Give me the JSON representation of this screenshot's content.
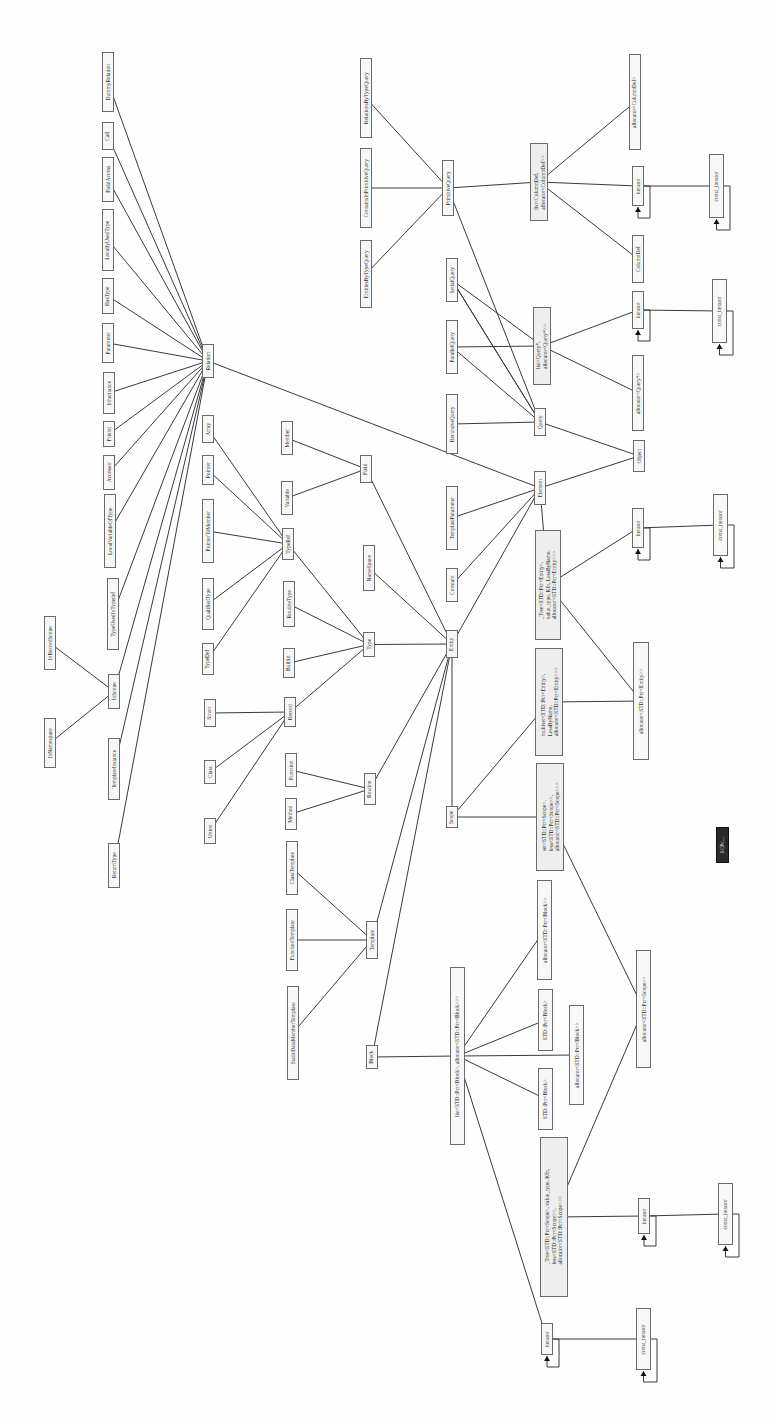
{
  "diagram": {
    "orientation": "rotated-90-ccw",
    "nodes": [
      {
        "id": "DummyRelation",
        "label": "DummyRelation",
        "x": 102,
        "y": 52,
        "w": 12,
        "h": 60
      },
      {
        "id": "Call",
        "label": "Call",
        "x": 102,
        "y": 122,
        "w": 12,
        "h": 28
      },
      {
        "id": "FieldAccess",
        "label": "FieldAccess",
        "x": 102,
        "y": 157,
        "w": 12,
        "h": 45
      },
      {
        "id": "LocallyUsedType",
        "label": "LocallyUsedType",
        "x": 102,
        "y": 209,
        "w": 12,
        "h": 62
      },
      {
        "id": "HasType",
        "label": "HasType",
        "x": 102,
        "y": 278,
        "w": 12,
        "h": 36
      },
      {
        "id": "Parameter",
        "label": "Parameter",
        "x": 102,
        "y": 323,
        "w": 12,
        "h": 40
      },
      {
        "id": "Inheritance",
        "label": "Inheritance",
        "x": 103,
        "y": 372,
        "w": 12,
        "h": 42
      },
      {
        "id": "Friend",
        "label": "Friend",
        "x": 103,
        "y": 421,
        "w": 12,
        "h": 26
      },
      {
        "id": "Accessor",
        "label": "Accessor",
        "x": 103,
        "y": 455,
        "w": 12,
        "h": 35
      },
      {
        "id": "LocalVariableOfType",
        "label": "LocalVariableOfType",
        "x": 104,
        "y": 494,
        "w": 12,
        "h": 74
      },
      {
        "id": "TypeUsedInTypedef",
        "label": "TypeUsedInTypedef",
        "x": 107,
        "y": 578,
        "w": 12,
        "h": 72
      },
      {
        "id": "InScope",
        "label": "InScope",
        "x": 108,
        "y": 674,
        "w": 12,
        "h": 35
      },
      {
        "id": "TemplateInstance",
        "label": "TemplateInstance",
        "x": 108,
        "y": 738,
        "w": 12,
        "h": 62
      },
      {
        "id": "ReturnType",
        "label": "ReturnType",
        "x": 108,
        "y": 843,
        "w": 12,
        "h": 45
      },
      {
        "id": "InRecordScope",
        "label": "InRecordScope",
        "x": 44,
        "y": 616,
        "w": 12,
        "h": 54
      },
      {
        "id": "InNamespace",
        "label": "InNamespace",
        "x": 44,
        "y": 718,
        "w": 12,
        "h": 50
      },
      {
        "id": "Relation",
        "label": "Relation",
        "x": 202,
        "y": 344,
        "w": 12,
        "h": 34
      },
      {
        "id": "Member",
        "label": "Member",
        "x": 281,
        "y": 421,
        "w": 12,
        "h": 34
      },
      {
        "id": "Variable",
        "label": "Variable",
        "x": 281,
        "y": 481,
        "w": 12,
        "h": 34
      },
      {
        "id": "Field",
        "label": "Field",
        "x": 360,
        "y": 455,
        "w": 12,
        "h": 28
      },
      {
        "id": "Array",
        "label": "Array",
        "x": 202,
        "y": 415,
        "w": 12,
        "h": 28
      },
      {
        "id": "Pointer",
        "label": "Pointer",
        "x": 202,
        "y": 455,
        "w": 12,
        "h": 30
      },
      {
        "id": "PointerToMember",
        "label": "PointerToMember",
        "x": 202,
        "y": 499,
        "w": 12,
        "h": 64
      },
      {
        "id": "QualifiedType",
        "label": "QualifiedType",
        "x": 202,
        "y": 578,
        "w": 12,
        "h": 52
      },
      {
        "id": "TypeDef",
        "label": "TypeDef",
        "x": 202,
        "y": 643,
        "w": 12,
        "h": 32
      },
      {
        "id": "TypeRef",
        "label": "TypeRef",
        "x": 282,
        "y": 528,
        "w": 12,
        "h": 32
      },
      {
        "id": "NameSpace",
        "label": "NameSpace",
        "x": 363,
        "y": 545,
        "w": 12,
        "h": 46
      },
      {
        "id": "RoutineType",
        "label": "RoutineType",
        "x": 283,
        "y": 581,
        "w": 12,
        "h": 46
      },
      {
        "id": "Builtin",
        "label": "Builtin",
        "x": 283,
        "y": 648,
        "w": 12,
        "h": 30
      },
      {
        "id": "Type",
        "label": "Type",
        "x": 363,
        "y": 632,
        "w": 12,
        "h": 25
      },
      {
        "id": "Struct",
        "label": "Struct",
        "x": 204,
        "y": 699,
        "w": 12,
        "h": 28
      },
      {
        "id": "Class",
        "label": "Class",
        "x": 204,
        "y": 760,
        "w": 12,
        "h": 24
      },
      {
        "id": "Union",
        "label": "Union",
        "x": 204,
        "y": 818,
        "w": 12,
        "h": 26
      },
      {
        "id": "Record",
        "label": "Record",
        "x": 284,
        "y": 697,
        "w": 12,
        "h": 30
      },
      {
        "id": "Function",
        "label": "Function",
        "x": 285,
        "y": 753,
        "w": 12,
        "h": 34
      },
      {
        "id": "Method",
        "label": "Method",
        "x": 285,
        "y": 798,
        "w": 12,
        "h": 32
      },
      {
        "id": "Routine",
        "label": "Routine",
        "x": 364,
        "y": 773,
        "w": 12,
        "h": 32
      },
      {
        "id": "ClassTemplate",
        "label": "ClassTemplate",
        "x": 286,
        "y": 841,
        "w": 12,
        "h": 54
      },
      {
        "id": "FunctionTemplate",
        "label": "FunctionTemplate",
        "x": 286,
        "y": 909,
        "w": 12,
        "h": 62
      },
      {
        "id": "StaticDataMemberTemplate",
        "label": "StaticDataMemberTemplate",
        "x": 287,
        "y": 986,
        "w": 12,
        "h": 94
      },
      {
        "id": "Template",
        "label": "Template",
        "x": 366,
        "y": 921,
        "w": 12,
        "h": 38
      },
      {
        "id": "Block",
        "label": "Block",
        "x": 366,
        "y": 1045,
        "w": 12,
        "h": 24
      },
      {
        "id": "Entity",
        "label": "Entity",
        "x": 446,
        "y": 630,
        "w": 12,
        "h": 28
      },
      {
        "id": "Scope",
        "label": "Scope",
        "x": 446,
        "y": 806,
        "w": 12,
        "h": 22
      },
      {
        "id": "Constant",
        "label": "Constant",
        "x": 446,
        "y": 568,
        "w": 12,
        "h": 34
      },
      {
        "id": "TemplateParameter",
        "label": "TemplateParameter",
        "x": 446,
        "y": 486,
        "w": 12,
        "h": 64
      },
      {
        "id": "Element",
        "label": "Element",
        "x": 534,
        "y": 471,
        "w": 12,
        "h": 34
      },
      {
        "id": "RecursiveQuery",
        "label": "RecursiveQuery",
        "x": 446,
        "y": 394,
        "w": 12,
        "h": 60
      },
      {
        "id": "Query",
        "label": "Query",
        "x": 534,
        "y": 408,
        "w": 12,
        "h": 28
      },
      {
        "id": "Object",
        "label": "Object",
        "x": 633,
        "y": 440,
        "w": 12,
        "h": 32
      },
      {
        "id": "ParallelQuery",
        "label": "ParallelQuery",
        "x": 446,
        "y": 320,
        "w": 12,
        "h": 54
      },
      {
        "id": "SerialQuery",
        "label": "SerialQuery",
        "x": 446,
        "y": 258,
        "w": 12,
        "h": 44
      },
      {
        "id": "ListQueryPtr",
        "label": "list<Query*,\nallocator<Query*>>",
        "x": 533,
        "y": 307,
        "w": 18,
        "h": 78
      },
      {
        "id": "AllocatorQuery",
        "label": "allocator<Query*>",
        "x": 632,
        "y": 355,
        "w": 12,
        "h": 76
      },
      {
        "id": "IteratorQ",
        "label": "iterator",
        "x": 632,
        "y": 291,
        "w": 12,
        "h": 38
      },
      {
        "id": "ConstIteratorQ",
        "label": "const_iterator",
        "x": 712,
        "y": 279,
        "w": 15,
        "h": 64
      },
      {
        "id": "EntitiesByTypeQuery",
        "label": "EntitiesByTypeQuery",
        "x": 360,
        "y": 240,
        "w": 12,
        "h": 68
      },
      {
        "id": "ContainsInPrimitiveQuery",
        "label": "ContainsInPrimitiveQuery",
        "x": 360,
        "y": 148,
        "w": 12,
        "h": 80
      },
      {
        "id": "RelationsByTypeQuery",
        "label": "RelationsByTypeQuery",
        "x": 360,
        "y": 58,
        "w": 12,
        "h": 80
      },
      {
        "id": "PrimitiveQuery",
        "label": "PrimitiveQuery",
        "x": 442,
        "y": 160,
        "w": 12,
        "h": 56
      },
      {
        "id": "ListColumnDef",
        "label": "list<ColumnDef,\nallocator<ColumnDef>>",
        "x": 530,
        "y": 143,
        "w": 18,
        "h": 78
      },
      {
        "id": "ColumnDef",
        "label": "ColumnDef",
        "x": 632,
        "y": 235,
        "w": 12,
        "h": 48
      },
      {
        "id": "IteratorC",
        "label": "iterator",
        "x": 632,
        "y": 166,
        "w": 12,
        "h": 40
      },
      {
        "id": "ConstIteratorC",
        "label": "const_iterator",
        "x": 709,
        "y": 154,
        "w": 15,
        "h": 64
      },
      {
        "id": "AllocatorColumnDef",
        "label": "allocator<ColumnDef>",
        "x": 629,
        "y": 54,
        "w": 12,
        "h": 96
      },
      {
        "id": "MapEntity",
        "label": "_Tree<STD::Pcr<Entity>,\nvalue_type, Kfn, LessByName,\nallocator<STD::Pcr<Entity>>>",
        "x": 535,
        "y": 530,
        "w": 26,
        "h": 110
      },
      {
        "id": "IteratorE",
        "label": "iterator",
        "x": 632,
        "y": 508,
        "w": 12,
        "h": 40
      },
      {
        "id": "ConstIteratorE",
        "label": "const_iterator",
        "x": 713,
        "y": 494,
        "w": 15,
        "h": 62
      },
      {
        "id": "MultisetEntity",
        "label": "multiset<STD::Pcr<Entity>,\nLessByName,\nallocator<STD::Pcr<Entity>>>",
        "x": 535,
        "y": 648,
        "w": 28,
        "h": 108
      },
      {
        "id": "AllocatorEntity",
        "label": "allocator<STD::Pcr<Entity>>",
        "x": 633,
        "y": 642,
        "w": 16,
        "h": 118
      },
      {
        "id": "SetScope",
        "label": "set<STD::Pcr<Scope>,\nless<STD::Pcr<Scope>>,\nallocator<STD::Pcr<Scope>>>",
        "x": 536,
        "y": 763,
        "w": 28,
        "h": 108
      },
      {
        "id": "DarkBlock",
        "label": "SCPc...",
        "x": 716,
        "y": 827,
        "w": 13,
        "h": 36,
        "dark": true
      },
      {
        "id": "ListBlock",
        "label": "list<STD::Pcr<Block>, allocator<STD::Pcr<Block>>>",
        "x": 450,
        "y": 967,
        "w": 15,
        "h": 178
      },
      {
        "id": "AllocatorBlock1",
        "label": "allocator<STD::Pcr<Block>>",
        "x": 537,
        "y": 880,
        "w": 15,
        "h": 100
      },
      {
        "id": "STDPcrBlock1",
        "label": "STD::Pcr<Block>",
        "x": 538,
        "y": 989,
        "w": 15,
        "h": 62
      },
      {
        "id": "AllocatorBlock2",
        "label": "allocator<STD::Pcr<Block>>",
        "x": 569,
        "y": 1005,
        "w": 15,
        "h": 100
      },
      {
        "id": "STDPcrBlock2",
        "label": "STD::Pcr<Block>",
        "x": 538,
        "y": 1068,
        "w": 15,
        "h": 62
      },
      {
        "id": "AllocatorScope",
        "label": "allocator<STD::Pcr<Scope>>",
        "x": 636,
        "y": 950,
        "w": 15,
        "h": 118
      },
      {
        "id": "TreeScope",
        "label": "_Tree<STD::Pcr<Scope>, value_type, Kfn,\nless<STD::Pcr<Scope>>,\nallocator<STD::Pcr<Scope>>>",
        "x": 540,
        "y": 1137,
        "w": 28,
        "h": 160
      },
      {
        "id": "IteratorS",
        "label": "iterator",
        "x": 638,
        "y": 1198,
        "w": 12,
        "h": 36
      },
      {
        "id": "ConstIteratorS",
        "label": "const_iterator",
        "x": 718,
        "y": 1183,
        "w": 15,
        "h": 62
      },
      {
        "id": "IteratorB",
        "label": "iterator",
        "x": 541,
        "y": 1323,
        "w": 12,
        "h": 32
      },
      {
        "id": "ConstIteratorB",
        "label": "const_iterator",
        "x": 636,
        "y": 1308,
        "w": 15,
        "h": 62
      }
    ],
    "edges": [
      [
        "DummyRelation",
        "Relation"
      ],
      [
        "Call",
        "Relation"
      ],
      [
        "FieldAccess",
        "Relation"
      ],
      [
        "LocallyUsedType",
        "Relation"
      ],
      [
        "HasType",
        "Relation"
      ],
      [
        "Parameter",
        "Relation"
      ],
      [
        "Inheritance",
        "Relation"
      ],
      [
        "Friend",
        "Relation"
      ],
      [
        "Accessor",
        "Relation"
      ],
      [
        "LocalVariableOfType",
        "Relation"
      ],
      [
        "TypeUsedInTypedef",
        "Relation"
      ],
      [
        "InScope",
        "Relation"
      ],
      [
        "TemplateInstance",
        "Relation"
      ],
      [
        "ReturnType",
        "Relation"
      ],
      [
        "InRecordScope",
        "InScope"
      ],
      [
        "InNamespace",
        "InScope"
      ],
      [
        "Relation",
        "Element"
      ],
      [
        "Member",
        "Field"
      ],
      [
        "Variable",
        "Field"
      ],
      [
        "Field",
        "Entity"
      ],
      [
        "Array",
        "TypeRef"
      ],
      [
        "Pointer",
        "TypeRef"
      ],
      [
        "PointerToMember",
        "TypeRef"
      ],
      [
        "QualifiedType",
        "TypeRef"
      ],
      [
        "TypeDef",
        "TypeRef"
      ],
      [
        "TypeRef",
        "Type"
      ],
      [
        "RoutineType",
        "Type"
      ],
      [
        "Builtin",
        "Type"
      ],
      [
        "Record",
        "Type"
      ],
      [
        "Type",
        "Entity"
      ],
      [
        "NameSpace",
        "Entity"
      ],
      [
        "Struct",
        "Record"
      ],
      [
        "Class",
        "Record"
      ],
      [
        "Union",
        "Record"
      ],
      [
        "Function",
        "Routine"
      ],
      [
        "Method",
        "Routine"
      ],
      [
        "Routine",
        "Entity"
      ],
      [
        "ClassTemplate",
        "Template"
      ],
      [
        "FunctionTemplate",
        "Template"
      ],
      [
        "StaticDataMemberTemplate",
        "Template"
      ],
      [
        "Template",
        "Entity"
      ],
      [
        "Block",
        "Entity"
      ],
      [
        "Scope",
        "Entity"
      ],
      [
        "Entity",
        "Element"
      ],
      [
        "Constant",
        "Element"
      ],
      [
        "TemplateParameter",
        "Element"
      ],
      [
        "Element",
        "Object"
      ],
      [
        "RecursiveQuery",
        "Query"
      ],
      [
        "ParallelQuery",
        "Query"
      ],
      [
        "SerialQuery",
        "Query"
      ],
      [
        "PrimitiveQuery",
        "Query"
      ],
      [
        "Query",
        "Object"
      ],
      [
        "ParallelQuery",
        "ListQueryPtr"
      ],
      [
        "SerialQuery",
        "ListQueryPtr"
      ],
      [
        "SerialQuery",
        "Query"
      ],
      [
        "ListQueryPtr",
        "AllocatorQuery"
      ],
      [
        "ListQueryPtr",
        "IteratorQ"
      ],
      [
        "IteratorQ",
        "ConstIteratorQ"
      ],
      [
        "EntitiesByTypeQuery",
        "PrimitiveQuery"
      ],
      [
        "ContainsInPrimitiveQuery",
        "PrimitiveQuery"
      ],
      [
        "RelationsByTypeQuery",
        "PrimitiveQuery"
      ],
      [
        "PrimitiveQuery",
        "ListColumnDef"
      ],
      [
        "ListColumnDef",
        "ColumnDef"
      ],
      [
        "ListColumnDef",
        "IteratorC"
      ],
      [
        "ListColumnDef",
        "AllocatorColumnDef"
      ],
      [
        "IteratorC",
        "ConstIteratorC"
      ],
      [
        "Element",
        "MapEntity"
      ],
      [
        "MapEntity",
        "IteratorE"
      ],
      [
        "MapEntity",
        "AllocatorEntity"
      ],
      [
        "IteratorE",
        "ConstIteratorE"
      ],
      [
        "Scope",
        "MultisetEntity"
      ],
      [
        "MultisetEntity",
        "AllocatorEntity"
      ],
      [
        "Scope",
        "SetScope"
      ],
      [
        "SetScope",
        "AllocatorScope"
      ],
      [
        "Block",
        "ListBlock"
      ],
      [
        "ListBlock",
        "AllocatorBlock1"
      ],
      [
        "ListBlock",
        "STDPcrBlock1"
      ],
      [
        "ListBlock",
        "AllocatorBlock2"
      ],
      [
        "ListBlock",
        "STDPcrBlock2"
      ],
      [
        "ListBlock",
        "IteratorB"
      ],
      [
        "TreeScope",
        "AllocatorScope"
      ],
      [
        "TreeScope",
        "IteratorS"
      ],
      [
        "IteratorS",
        "ConstIteratorS"
      ],
      [
        "IteratorB",
        "ConstIteratorB"
      ]
    ],
    "self_loops": [
      "IteratorQ",
      "ConstIteratorQ",
      "IteratorC",
      "ConstIteratorC",
      "IteratorE",
      "ConstIteratorE",
      "IteratorS",
      "ConstIteratorS",
      "IteratorB",
      "ConstIteratorB"
    ]
  }
}
